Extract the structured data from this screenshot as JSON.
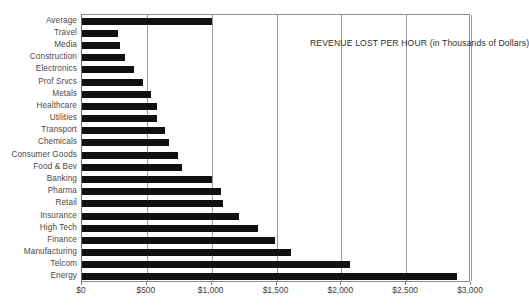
{
  "chart_data": {
    "type": "bar",
    "orientation": "horizontal",
    "title": "REVENUE LOST PER HOUR (in Thousands of Dollars)",
    "xlabel": "",
    "ylabel": "",
    "xlim": [
      0,
      3000
    ],
    "xticks": [
      0,
      500,
      1000,
      1500,
      2000,
      2500,
      3000
    ],
    "xticklabels": [
      "$0",
      "$500",
      "$1,000",
      "$1,500",
      "$2,000",
      "$2,500",
      "$3,000"
    ],
    "grid": "vertical",
    "legend": "none",
    "bar_color": "#111111",
    "categories": [
      "Average",
      "Travel",
      "Media",
      "Construction",
      "Electronics",
      "Prof Srvcs",
      "Metals",
      "Healthcare",
      "Utilities",
      "Transport",
      "Chemicals",
      "Consumer Goods",
      "Food & Bev",
      "Banking",
      "Pharma",
      "Retail",
      "Insurance",
      "High Tech",
      "Finance",
      "Manufacturing",
      "Telcom",
      "Energy"
    ],
    "values": [
      1000,
      280,
      290,
      330,
      400,
      470,
      530,
      580,
      580,
      640,
      670,
      740,
      770,
      1000,
      1070,
      1090,
      1210,
      1360,
      1490,
      1610,
      2070,
      2890
    ]
  }
}
